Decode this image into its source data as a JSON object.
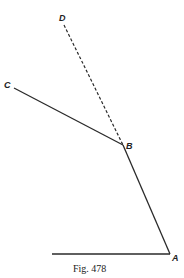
{
  "figure": {
    "caption": "Fig. 478",
    "top_marker": "",
    "labels": {
      "A": "A",
      "B": "B",
      "C": "C",
      "D": "D"
    },
    "segments": [
      {
        "from": "C",
        "to": "B",
        "style": "solid"
      },
      {
        "from": "B",
        "to": "A",
        "style": "solid"
      },
      {
        "from": "B",
        "to": "D",
        "style": "dashed"
      },
      {
        "from": "base",
        "to": "A",
        "style": "solid"
      }
    ],
    "line_color": "#2a2a2a"
  }
}
